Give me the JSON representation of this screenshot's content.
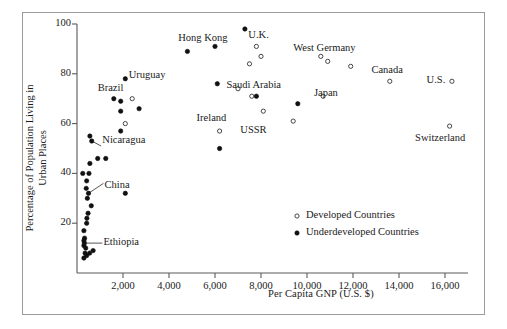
{
  "chart_data": {
    "type": "scatter",
    "title": "",
    "xlabel": "Per Capita GNP (U.S. $)",
    "ylabel": "Percentage of Population Living in Urban Places",
    "ylabel_line1": "Percentage of Population Living in",
    "ylabel_line2": "Urban Places",
    "xlim": [
      0,
      17000
    ],
    "ylim": [
      0,
      100
    ],
    "grid": false,
    "xticks": [
      2000,
      4000,
      6000,
      8000,
      10000,
      12000,
      14000,
      16000
    ],
    "xtick_labels": [
      "2,000",
      "4,000",
      "6,000",
      "8,000",
      "10,000",
      "12,000",
      "14,000",
      "16,000"
    ],
    "yticks": [
      20,
      40,
      60,
      80,
      100
    ],
    "ytick_labels": [
      "20",
      "40",
      "60",
      "80",
      "100"
    ],
    "legend": {
      "position": "inside-lower-right",
      "entries": [
        {
          "label": "Developed Countries",
          "marker": "open-circle"
        },
        {
          "label": "Underdeveloped Countries",
          "marker": "filled-circle"
        }
      ]
    },
    "series": [
      {
        "name": "Developed Countries",
        "marker": "open-circle",
        "points": [
          {
            "x": 2400,
            "y": 70
          },
          {
            "x": 2100,
            "y": 60
          },
          {
            "x": 6200,
            "y": 57
          },
          {
            "x": 7000,
            "y": 74
          },
          {
            "x": 7500,
            "y": 84
          },
          {
            "x": 7600,
            "y": 71
          },
          {
            "x": 7800,
            "y": 91
          },
          {
            "x": 8000,
            "y": 87
          },
          {
            "x": 8100,
            "y": 65
          },
          {
            "x": 9400,
            "y": 61
          },
          {
            "x": 10600,
            "y": 87
          },
          {
            "x": 10900,
            "y": 85
          },
          {
            "x": 10700,
            "y": 71
          },
          {
            "x": 11900,
            "y": 83
          },
          {
            "x": 13600,
            "y": 77
          },
          {
            "x": 16300,
            "y": 77
          },
          {
            "x": 16200,
            "y": 59
          }
        ]
      },
      {
        "name": "Underdeveloped Countries",
        "marker": "filled-circle",
        "points": [
          {
            "x": 300,
            "y": 6
          },
          {
            "x": 350,
            "y": 8
          },
          {
            "x": 380,
            "y": 10
          },
          {
            "x": 300,
            "y": 11
          },
          {
            "x": 320,
            "y": 12
          },
          {
            "x": 420,
            "y": 7
          },
          {
            "x": 550,
            "y": 8
          },
          {
            "x": 700,
            "y": 9
          },
          {
            "x": 300,
            "y": 13
          },
          {
            "x": 330,
            "y": 14
          },
          {
            "x": 300,
            "y": 17
          },
          {
            "x": 420,
            "y": 20
          },
          {
            "x": 430,
            "y": 22
          },
          {
            "x": 480,
            "y": 24
          },
          {
            "x": 620,
            "y": 27
          },
          {
            "x": 450,
            "y": 30
          },
          {
            "x": 500,
            "y": 32
          },
          {
            "x": 400,
            "y": 34
          },
          {
            "x": 420,
            "y": 37
          },
          {
            "x": 250,
            "y": 40
          },
          {
            "x": 520,
            "y": 40
          },
          {
            "x": 2100,
            "y": 32
          },
          {
            "x": 560,
            "y": 44
          },
          {
            "x": 900,
            "y": 46
          },
          {
            "x": 1250,
            "y": 46
          },
          {
            "x": 640,
            "y": 53
          },
          {
            "x": 560,
            "y": 55
          },
          {
            "x": 1900,
            "y": 57
          },
          {
            "x": 1900,
            "y": 65
          },
          {
            "x": 1900,
            "y": 69
          },
          {
            "x": 1600,
            "y": 70
          },
          {
            "x": 2100,
            "y": 78
          },
          {
            "x": 2700,
            "y": 66
          },
          {
            "x": 4800,
            "y": 89
          },
          {
            "x": 6000,
            "y": 91
          },
          {
            "x": 6100,
            "y": 76
          },
          {
            "x": 6200,
            "y": 50
          },
          {
            "x": 7300,
            "y": 98
          },
          {
            "x": 7800,
            "y": 71
          },
          {
            "x": 9600,
            "y": 68
          }
        ]
      }
    ],
    "annotations": [
      {
        "text": "Hong Kong",
        "x": 4400,
        "y": 94
      },
      {
        "text": "U.K.",
        "x": 7450,
        "y": 95
      },
      {
        "text": "West Germany",
        "x": 9400,
        "y": 90
      },
      {
        "text": "Canada",
        "x": 12800,
        "y": 81
      },
      {
        "text": "U.S.",
        "x": 15200,
        "y": 77
      },
      {
        "text": "Uruguay",
        "x": 2250,
        "y": 79
      },
      {
        "text": "Brazil",
        "x": 900,
        "y": 74
      },
      {
        "text": "Saudi Arabia",
        "x": 6500,
        "y": 75
      },
      {
        "text": "Japan",
        "x": 10300,
        "y": 72
      },
      {
        "text": "Ireland",
        "x": 5200,
        "y": 62
      },
      {
        "text": "USSR",
        "x": 7100,
        "y": 57
      },
      {
        "text": "Switzerland",
        "x": 14700,
        "y": 54
      },
      {
        "text": "Nicaragua",
        "x": 1100,
        "y": 53
      },
      {
        "text": "China",
        "x": 1200,
        "y": 35
      },
      {
        "text": "Ethiopia",
        "x": 1150,
        "y": 12
      }
    ],
    "leader_lines": [
      {
        "from_x": 640,
        "from_y": 53,
        "to_x": 1050,
        "to_y": 51
      },
      {
        "from_x": 500,
        "from_y": 32,
        "to_x": 1150,
        "to_y": 36
      },
      {
        "from_x": 330,
        "from_y": 12,
        "to_x": 1100,
        "to_y": 12
      }
    ]
  }
}
